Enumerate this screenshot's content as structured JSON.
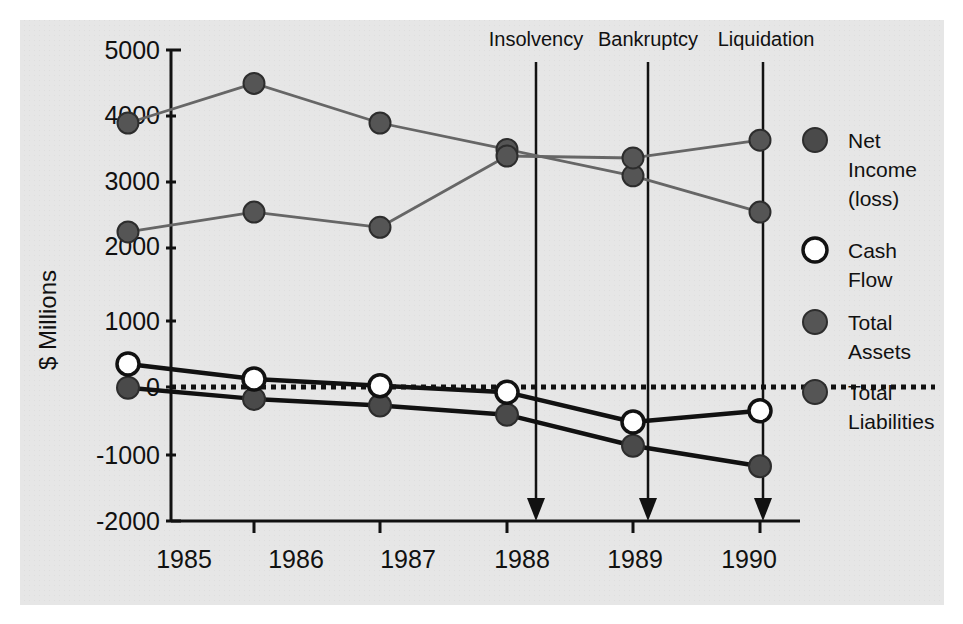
{
  "chart_data": {
    "type": "line",
    "title": "",
    "xlabel": "",
    "ylabel": "$ Millions",
    "categories": [
      "1985",
      "1986",
      "1987",
      "1988",
      "1989",
      "1990"
    ],
    "x_tick_labels": [
      "1985",
      "1986",
      "1987",
      "1988",
      "1989",
      "1990"
    ],
    "y_tick_labels": [
      "5000",
      "4000",
      "3000",
      "2000",
      "1000",
      "0",
      "-1000",
      "-2000"
    ],
    "y_ticks": [
      5000,
      4000,
      3000,
      2000,
      1000,
      0,
      -1000,
      -2000
    ],
    "ylim": [
      -2000,
      5000
    ],
    "grid": false,
    "legend_position": "right",
    "zero_line": true,
    "zero_line_style": "dotted",
    "series": [
      {
        "name": "Net Income (loss)",
        "marker": "filled-dark-circle",
        "marker_color": "#4a4a4a",
        "line_color": "#111111",
        "values": [
          -10,
          -180,
          -280,
          -420,
          -890,
          -1200
        ]
      },
      {
        "name": "Cash Flow",
        "marker": "open-white-circle",
        "marker_color": "#ffffff",
        "line_color": "#111111",
        "values": [
          350,
          120,
          20,
          -80,
          -530,
          -360
        ]
      },
      {
        "name": "Total Assets",
        "marker": "filled-gray-circle",
        "marker_color": "#555555",
        "line_color": "#666666",
        "values": [
          4000,
          4600,
          4000,
          3600,
          3200,
          2650
        ]
      },
      {
        "name": "Total Liabilities",
        "marker": "filled-gray-circle",
        "marker_color": "#555555",
        "line_color": "#666666",
        "values": [
          2350,
          2650,
          2420,
          3500,
          3470,
          3740
        ]
      }
    ],
    "annotations": [
      {
        "label": "Insolvency",
        "x_value": 1988.23
      },
      {
        "label": "Bankruptcy",
        "x_value": 1989.11
      },
      {
        "label": "Liquidation",
        "x_value": 1990.02
      }
    ]
  },
  "legend": {
    "entries": [
      {
        "label_line1": "Net",
        "label_line2": "Income",
        "label_line3": "(loss)",
        "swatch": "dark-filled"
      },
      {
        "label_line1": "Cash",
        "label_line2": "Flow",
        "label_line3": "",
        "swatch": "white-open"
      },
      {
        "label_line1": "Total",
        "label_line2": "Assets",
        "label_line3": "",
        "swatch": "gray-filled"
      },
      {
        "label_line1": "Total",
        "label_line2": "Liabilities",
        "label_line3": "",
        "swatch": "gray-filled"
      }
    ]
  },
  "colors": {
    "panel_background": "#e6e6e6",
    "page_background": "#ffffff",
    "axis": "#111111",
    "dark_marker": "#4a4a4a",
    "gray_marker": "#555555",
    "gray_line": "#666666",
    "dark_line": "#111111",
    "white_marker": "#ffffff"
  }
}
